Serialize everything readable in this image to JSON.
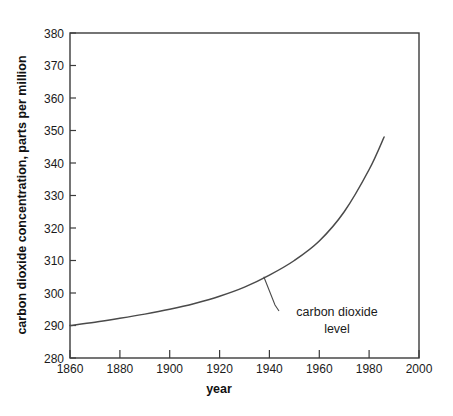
{
  "chart_data": {
    "type": "line",
    "title": "",
    "xlabel": "year",
    "ylabel": "carbon dioxide concentration, parts per million",
    "xlim": [
      1860,
      2000
    ],
    "ylim": [
      280,
      380
    ],
    "grid": false,
    "legend": "none",
    "xticks": [
      1860,
      1880,
      1900,
      1920,
      1940,
      1960,
      1980,
      2000
    ],
    "xtick_labels": [
      "1860",
      "1880",
      "1900",
      "1920",
      "1940",
      "1960",
      "1980",
      "2000"
    ],
    "yticks": [
      280,
      290,
      300,
      310,
      320,
      330,
      340,
      350,
      360,
      370,
      380
    ],
    "ytick_labels": [
      "280",
      "290",
      "300",
      "310",
      "320",
      "330",
      "340",
      "350",
      "360",
      "370",
      "380"
    ],
    "series": [
      {
        "name": "carbon dioxide level",
        "color": "#4a4a4a",
        "x": [
          1860,
          1870,
          1880,
          1890,
          1900,
          1910,
          1920,
          1930,
          1940,
          1950,
          1960,
          1970,
          1980,
          1986
        ],
        "values": [
          290.0,
          291.0,
          292.2,
          293.5,
          295.0,
          296.8,
          299.0,
          301.8,
          305.5,
          310.0,
          316.0,
          325.0,
          338.0,
          348.0
        ]
      }
    ],
    "annotations": [
      {
        "text_lines": [
          "carbon dioxide",
          "level"
        ],
        "points_to_x": 1938,
        "points_to_y": 305.5
      }
    ]
  },
  "axis": {
    "x_title": "year",
    "y_title": "carbon dioxide concentration, parts per million"
  },
  "annotation": {
    "line1": "carbon dioxide",
    "line2": "level"
  },
  "colors": {
    "curve": "#4a4a4a",
    "frame": "#3b3b3b",
    "text": "#1a1a1a",
    "background": "#ffffff"
  }
}
